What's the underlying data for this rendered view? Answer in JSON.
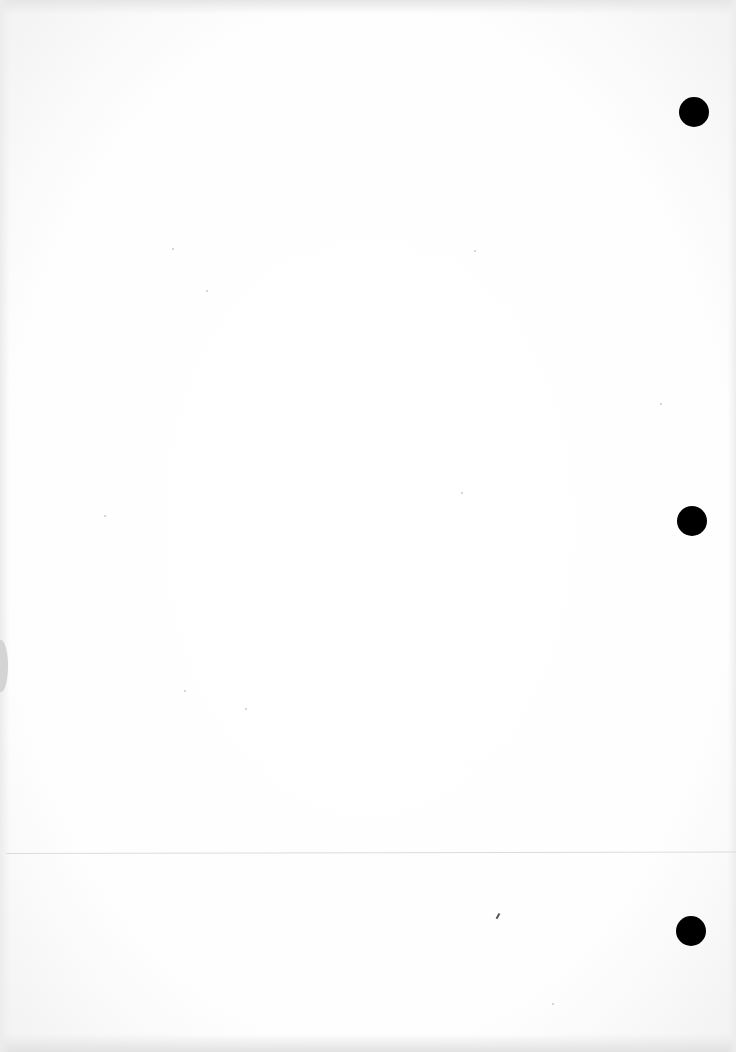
{
  "document": {
    "type": "blank scanned page",
    "text_content": [],
    "background_color": "#ffffff",
    "punch_holes": [
      {
        "cx": 694,
        "cy": 112,
        "r": 15,
        "color": "#000000"
      },
      {
        "cx": 692,
        "cy": 521,
        "r": 15,
        "color": "#000000"
      },
      {
        "cx": 691,
        "cy": 931,
        "r": 15,
        "color": "#000000"
      }
    ],
    "fold_line": {
      "y": 853,
      "color": "#dcdcdc"
    },
    "left_edge_shadow": {
      "y": 640,
      "height": 52,
      "color": "#d4d4d4"
    },
    "marks": [
      {
        "x": 497,
        "y": 913,
        "kind": "pen-mark"
      }
    ]
  }
}
